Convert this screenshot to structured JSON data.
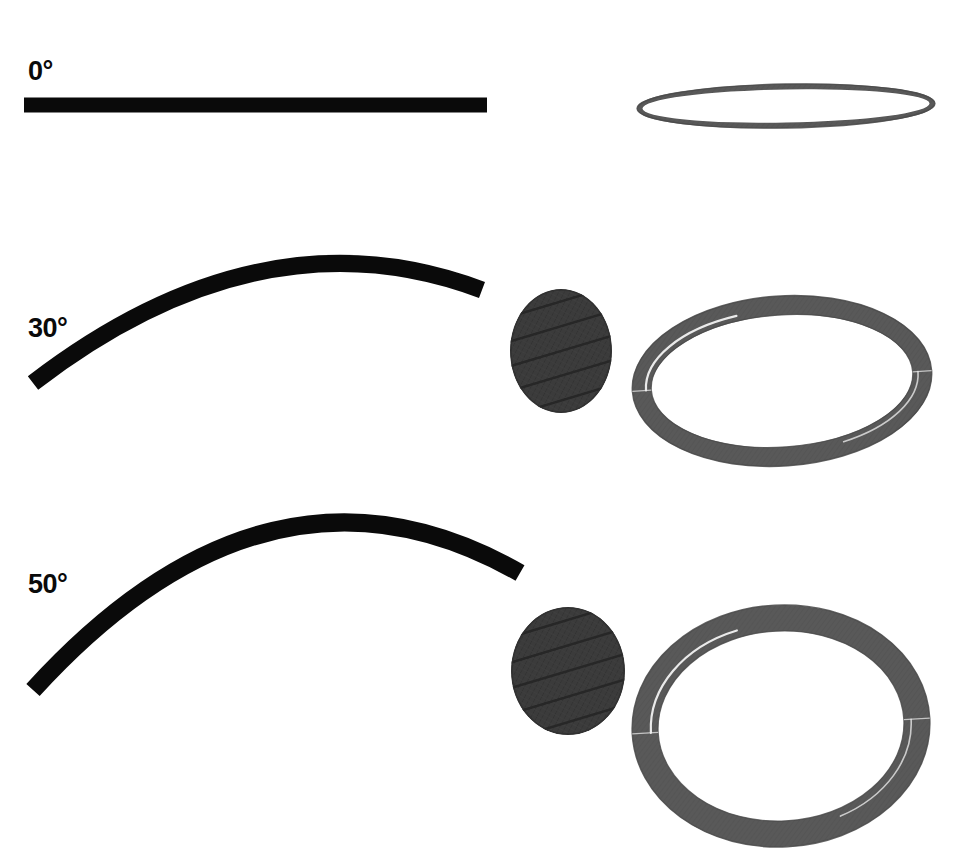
{
  "figure": {
    "background_color": "#ffffff",
    "width": 962,
    "height": 857
  },
  "colors": {
    "rod_black": "#0a0a0a",
    "disk_dark_gray": "#3c3c3c",
    "disk_striation": "#262626",
    "ring_gray": "#595959",
    "ring_shadow": "#4a4a4a",
    "ring_highlight": "#f2f2f2",
    "label_black": "#0a0a0a"
  },
  "rows": [
    {
      "id": "row-0deg",
      "label": "0°",
      "label_x": 28,
      "label_y": 58,
      "rod": {
        "name": "straight-rod",
        "shape": "straight",
        "x1": 24,
        "y1": 105,
        "x2": 487,
        "y2": 105,
        "thickness": 15,
        "color": "#0a0a0a"
      },
      "disk": {
        "name": "textured-disk",
        "cx": 565,
        "cy": 90,
        "rx": 57,
        "ry": 62,
        "rotation": 0,
        "color": "#3c3c3c",
        "striation_count": 5
      },
      "ring": {
        "name": "torus-ring",
        "cx": 786,
        "cy": 106,
        "rx": 149,
        "ry": 22,
        "band": 6,
        "rotation": -1,
        "color": "#595959"
      }
    },
    {
      "id": "row-30deg",
      "label": "30°",
      "label_x": 28,
      "label_y": 315,
      "rod": {
        "name": "bent-rod",
        "shape": "arc",
        "x1": 33,
        "y1": 383,
        "cx": 262,
        "cy": 207,
        "x2": 482,
        "y2": 290,
        "thickness": 17,
        "color": "#0a0a0a"
      },
      "disk": {
        "name": "textured-disk",
        "cx": 561,
        "cy": 351,
        "rx": 51,
        "ry": 62,
        "rotation": 0,
        "color": "#3c3c3c",
        "striation_count": 5
      },
      "ring": {
        "name": "torus-ring",
        "cx": 782,
        "cy": 381,
        "rx": 150,
        "ry": 85,
        "band": 19,
        "rotation": -4,
        "color": "#595959"
      }
    },
    {
      "id": "row-50deg",
      "label": "50°",
      "label_x": 28,
      "label_y": 571,
      "rod": {
        "name": "bent-rod",
        "shape": "arc",
        "x1": 33,
        "y1": 690,
        "cx": 270,
        "cy": 430,
        "x2": 520,
        "y2": 573,
        "thickness": 18,
        "color": "#0a0a0a"
      },
      "disk": {
        "name": "textured-disk",
        "cx": 568,
        "cy": 671,
        "rx": 57,
        "ry": 64,
        "rotation": 0,
        "color": "#3c3c3c",
        "striation_count": 5
      },
      "ring": {
        "name": "torus-ring",
        "cx": 781,
        "cy": 726,
        "rx": 149,
        "ry": 121,
        "band": 26,
        "rotation": -3,
        "color": "#595959"
      }
    }
  ]
}
